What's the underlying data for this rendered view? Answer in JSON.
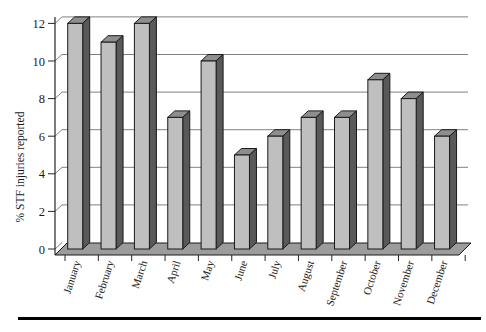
{
  "chart_data": {
    "type": "bar",
    "style": "3d-column",
    "title": "",
    "xlabel": "",
    "ylabel": "% STF injuries reported",
    "categories": [
      "January",
      "February",
      "March",
      "April",
      "May",
      "June",
      "July",
      "August",
      "September",
      "October",
      "November",
      "December"
    ],
    "values": [
      12,
      11,
      12,
      7,
      10,
      5,
      6,
      7,
      7,
      9,
      8,
      6
    ],
    "yticks": [
      0,
      2,
      4,
      6,
      8,
      10,
      12
    ],
    "ylim": [
      0,
      12
    ],
    "grid": true,
    "legend_position": "none",
    "colors": {
      "bar_front": "#bfbfbf",
      "bar_side": "#595959",
      "bar_top": "#8e8e8e",
      "bar_outline": "#1a1a1a",
      "floor": "#9c9c9c",
      "gridline": "#808080",
      "axis": "#262626",
      "text": "#1a1a1a",
      "bottom_rule": "#000000"
    }
  }
}
